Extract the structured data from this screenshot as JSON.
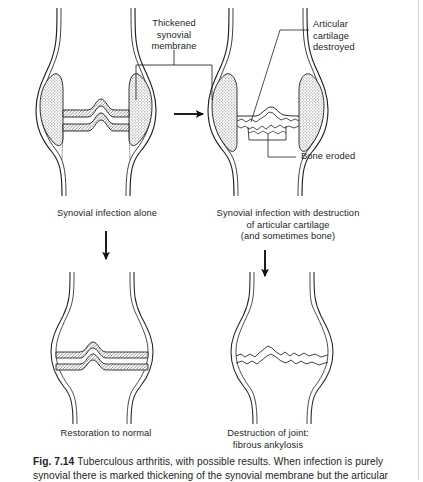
{
  "figure": {
    "id": "fig-7-14",
    "number": "Fig. 7.14",
    "caption_line1": "Tuberculous arthritis, with possible results. When infection is purely",
    "caption_line2": "synovial there is marked thickening of the synovial membrane but the articular"
  },
  "labels": {
    "thickened_synovial_membrane": "Thickened\nsynovial\nmembrane",
    "articular_cartilage_destroyed": "Articular\ncartilage\ndestroyed",
    "bone_eroded": "Bone eroded"
  },
  "panels": [
    {
      "id": "panel-top-left",
      "caption": "Synovial infection alone",
      "state": "synovial-thickening"
    },
    {
      "id": "panel-top-right",
      "caption": "Synovial infection with destruction\nof articular cartilage\n(and sometimes bone)",
      "state": "cartilage-destroyed"
    },
    {
      "id": "panel-bottom-left",
      "caption": "Restoration to normal",
      "state": "normal"
    },
    {
      "id": "panel-bottom-right",
      "caption": "Destruction of joint:\nfibrous ankylosis",
      "state": "ankylosis"
    }
  ],
  "arrows": [
    {
      "id": "arrow-right",
      "direction": "right"
    },
    {
      "id": "arrow-down-left",
      "direction": "down"
    },
    {
      "id": "arrow-down-right",
      "direction": "down"
    }
  ],
  "colors": {
    "ink": "#231f20",
    "stipple": "#8a8a8a",
    "hatch": "#6e6e6e",
    "paper": "#ffffff"
  }
}
